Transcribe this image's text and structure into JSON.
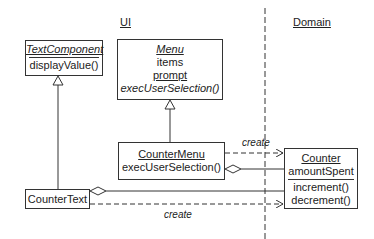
{
  "packages": {
    "ui": {
      "label": "UI"
    },
    "domain": {
      "label": "Domain"
    }
  },
  "classes": {
    "text_component": {
      "name": "TextComponent",
      "operations": [
        "displayValue()"
      ]
    },
    "menu": {
      "name": "Menu",
      "attributes": [
        "items",
        "prompt"
      ],
      "operations": [
        "execUserSelection()"
      ]
    },
    "counter_menu": {
      "name": "CounterMenu",
      "operations": [
        "execUserSelection()"
      ]
    },
    "counter_text": {
      "name": "CounterText"
    },
    "counter": {
      "name": "Counter",
      "attributes": [
        "amountSpent"
      ],
      "operations": [
        "increment()",
        "decrement()"
      ]
    }
  },
  "relations": {
    "create_1": "create",
    "create_2": "create"
  }
}
